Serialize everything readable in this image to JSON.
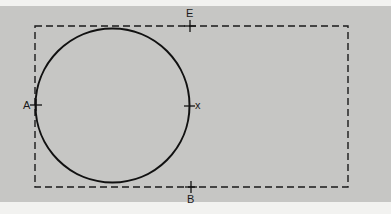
{
  "diagram": {
    "type": "geometry-figure",
    "background_color": "#c6c6c4",
    "line_color": "#111111",
    "points": {
      "A": {
        "label": "A",
        "x": 36,
        "y": 105
      },
      "X": {
        "label": "x",
        "x": 189,
        "y": 105
      },
      "E": {
        "label": "E",
        "x": 190,
        "y": 26
      },
      "B": {
        "label": "B",
        "x": 191,
        "y": 187
      }
    },
    "circle": {
      "cx": 112.5,
      "cy": 105.5,
      "r": 77
    },
    "dashed_rectangle": {
      "x": 35,
      "y": 26,
      "width": 313,
      "height": 161
    }
  }
}
